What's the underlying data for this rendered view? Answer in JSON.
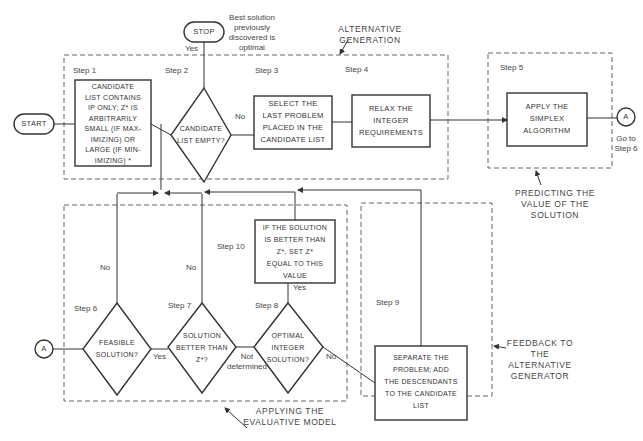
{
  "diagram": {
    "terminals": {
      "start": "START",
      "stop": "STOP",
      "connector_out": "A",
      "connector_in": "A"
    },
    "notes": {
      "stop_note": "Best solution\npreviously\ndiscovered is\noptimal",
      "goto_step6": "Go to\nStep 6"
    },
    "groups": {
      "alternative_generation": "ALTERNATIVE\nGENERATION",
      "predicting": "PREDICTING THE\nVALUE OF THE\nSOLUTION",
      "applying": "APPLYING THE\nEVALUATIVE MODEL",
      "feedback": "FEEDBACK TO\nTHE\nALTERNATIVE\nGENERATOR"
    },
    "steps": [
      {
        "step": "Step 1",
        "type": "process",
        "text": "CANDIDATE\nLIST CONTAINS\nIP ONLY; Z* IS\nARBITRARILY\nSMALL (IF MAX-\nIMIZING) OR\nLARGE (IF MIN-\nIMIZING)  *"
      },
      {
        "step": "Step 2",
        "type": "decision",
        "text": "CANDIDATE\nLIST EMPTY?"
      },
      {
        "step": "Step 3",
        "type": "process",
        "text": "SELECT THE\nLAST PROBLEM\nPLACED IN THE\nCANDIDATE LIST"
      },
      {
        "step": "Step 4",
        "type": "process",
        "text": "RELAX THE\nINTEGER\nREQUIREMENTS"
      },
      {
        "step": "Step 5",
        "type": "process",
        "text": "APPLY THE\nSIMPLEX\nALGORITHM"
      },
      {
        "step": "Step 6",
        "type": "decision",
        "text": "FEASIBLE\nSOLUTION?"
      },
      {
        "step": "Step 7",
        "type": "decision",
        "text": "SOLUTION\nBETTER THAN\nZ*?"
      },
      {
        "step": "Step 8",
        "type": "decision",
        "text": "OPTIMAL\nINTEGER\nSOLUTION?"
      },
      {
        "step": "Step 9",
        "type": "process",
        "text": "SEPARATE THE\nPROBLEM; ADD\nTHE DESCENDANTS\nTO THE CANDIDATE\nLIST"
      },
      {
        "step": "Step 10",
        "type": "process",
        "text": "IF THE SOLUTION\nIS BETTER THAN\nZ*, SET Z*\nEQUAL TO THIS\nVALUE"
      }
    ],
    "edge_labels": {
      "step2_yes": "Yes",
      "step2_no": "No",
      "step6_no": "No",
      "step6_yes": "Yes",
      "step7_no": "No",
      "step7_not_determined": "Not\ndetermined",
      "step8_yes": "Yes",
      "step8_no": "No"
    },
    "colors": {
      "line": "#333333",
      "dashed_group": "#555555",
      "background": "#ffffff"
    }
  }
}
